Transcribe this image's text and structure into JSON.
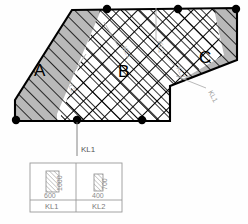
{
  "drawing": {
    "title": "slab-region-hatching-plan",
    "regions": [
      {
        "id": "A",
        "label": "A",
        "fill": "#b9b9b9",
        "hatch": "single-diagonal"
      },
      {
        "id": "B",
        "label": "B",
        "fill": "#ffffff",
        "hatch": "cross-diagonal"
      },
      {
        "id": "C",
        "label": "C",
        "fill": "#b9b9b9",
        "hatch": "single-diagonal"
      }
    ],
    "annotations": [
      {
        "text": "KL1",
        "style": "leader-gray",
        "position": "upper-middle"
      },
      {
        "text": "KL1",
        "style": "leader-gray",
        "position": "middle"
      },
      {
        "text": "KL2",
        "style": "leader-gray",
        "position": "left-middle"
      },
      {
        "text": "KL2",
        "style": "leader-gray",
        "position": "upper-left-inner"
      },
      {
        "text": "KL1",
        "style": "leader-gray",
        "position": "right-lower"
      },
      {
        "text": "KL1",
        "style": "leader-black",
        "position": "bottom-callout"
      }
    ],
    "node_color": "#000000",
    "outline_color": "#000000"
  },
  "legend": {
    "name": "beam-section-legend",
    "columns": [
      {
        "name": "KL1",
        "width": "600",
        "height": "1000",
        "hatch": "single-diagonal"
      },
      {
        "name": "KL2",
        "width": "400",
        "height": "700",
        "hatch": "single-diagonal"
      }
    ],
    "border_color": "#9a9a9a"
  },
  "colors": {
    "gray_fill": "#b9b9b9",
    "line": "#000000",
    "faint": "#b0b0b0",
    "legend_line": "#9a9a9a"
  }
}
